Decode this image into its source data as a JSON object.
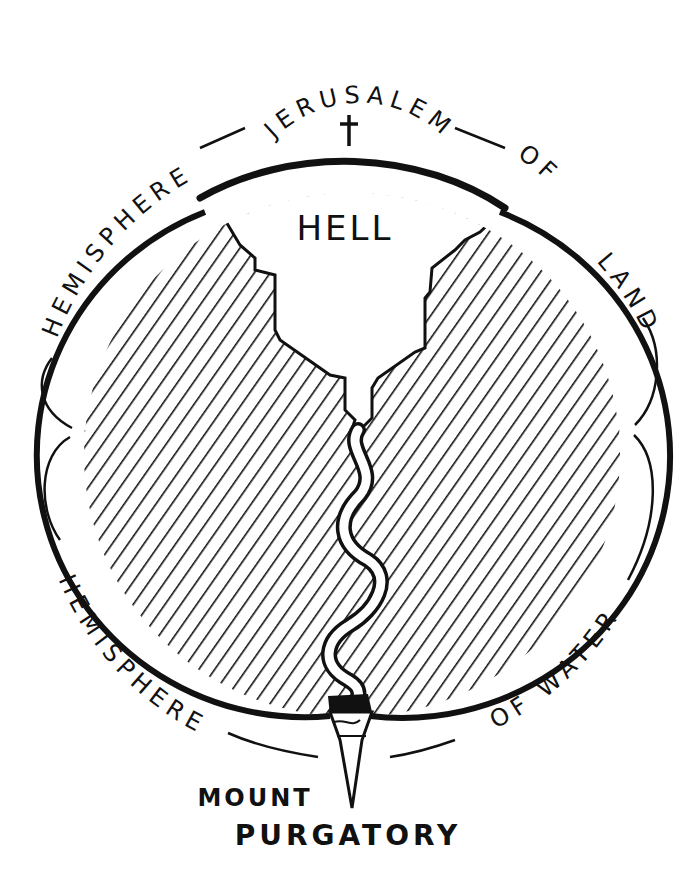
{
  "diagram": {
    "labels": {
      "jerusalem": "JERUSALEM",
      "hemisphere_of_land_left": "HEMISPHERE",
      "hemisphere_of_land_right_of": "OF",
      "hemisphere_of_land_right_land": "LAND",
      "hell": "HELL",
      "hemisphere_of_water_left": "HEMISPHERE",
      "hemisphere_of_water_right": "OF WATER",
      "mount": "MOUNT",
      "purgatory": "PURGATORY"
    },
    "icons": {
      "cross": "cross-icon"
    },
    "colors": {
      "ink": "#111111",
      "paper": "#ffffff"
    }
  }
}
